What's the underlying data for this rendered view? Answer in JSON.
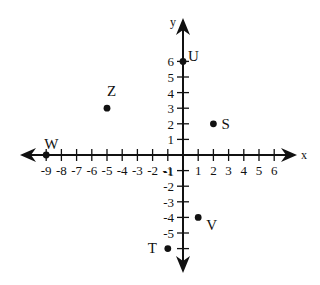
{
  "chart_data": {
    "type": "scatter",
    "title": "",
    "xlabel": "x",
    "ylabel": "y",
    "xlim": [
      -10,
      7
    ],
    "ylim": [
      -7,
      7
    ],
    "grid": false,
    "legend": null,
    "x_ticks": [
      -9,
      -8,
      -7,
      -6,
      -5,
      -4,
      -3,
      -2,
      -1,
      1,
      2,
      3,
      4,
      5,
      6
    ],
    "y_ticks": [
      -6,
      -5,
      -4,
      -3,
      -2,
      -1,
      1,
      2,
      3,
      4,
      5,
      6
    ],
    "x_tick_labels": [
      "-9",
      "-8",
      "-7",
      "-6",
      "-5",
      "-4",
      "-3",
      "-2",
      "-1",
      "1",
      "2",
      "3",
      "4",
      "5",
      "6"
    ],
    "y_tick_labels": [
      "-5",
      "-4",
      "-3",
      "-2",
      "-1",
      "1",
      "2",
      "3",
      "4",
      "5",
      "6"
    ],
    "points": [
      {
        "label": "U",
        "x": 0,
        "y": 6
      },
      {
        "label": "Z",
        "x": -5,
        "y": 3
      },
      {
        "label": "S",
        "x": 2,
        "y": 2
      },
      {
        "label": "W",
        "x": -9,
        "y": 0
      },
      {
        "label": "V",
        "x": 1,
        "y": -4
      },
      {
        "label": "T",
        "x": -1,
        "y": -6
      }
    ]
  },
  "axes": {
    "x_name": "x",
    "y_name": "y"
  }
}
